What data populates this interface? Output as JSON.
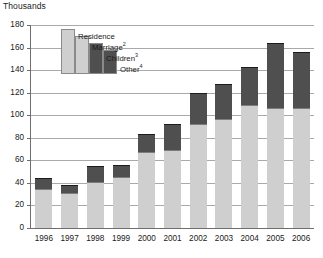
{
  "chart_data": {
    "type": "bar",
    "subtype": "stacked-column",
    "title": "Thousands",
    "xlabel": "",
    "ylabel": "Thousands",
    "ylim": [
      0,
      180
    ],
    "ytick_step": 20,
    "grid": true,
    "legend_position": "inside-top-left",
    "categories": [
      "1996",
      "1997",
      "1998",
      "1999",
      "2000",
      "2001",
      "2002",
      "2003",
      "2004",
      "2005",
      "2006"
    ],
    "series": [
      {
        "name": "Residence",
        "color": "#cfcfcf",
        "values": [
          22,
          19,
          24,
          26,
          39,
          40,
          52,
          55,
          59,
          79,
          79
        ]
      },
      {
        "name": "Marriage",
        "color": "#cfcfcf",
        "values": [
          13,
          12,
          17,
          19,
          28,
          29,
          40,
          42,
          50,
          27,
          27
        ]
      },
      {
        "name": "Children",
        "color": "#4f4f4f",
        "values": [
          8,
          6,
          13,
          10,
          15,
          22,
          27,
          30,
          33,
          56,
          49
        ]
      },
      {
        "name": "Other",
        "color": "#4f4f4f",
        "values": [
          1,
          1,
          1,
          1,
          1,
          1,
          1,
          1,
          1,
          2,
          1
        ]
      }
    ],
    "totals": [
      44,
      38,
      55,
      56,
      83,
      92,
      120,
      128,
      143,
      164,
      156
    ]
  },
  "axis": {
    "title": "Thousands",
    "y_ticks": [
      "180",
      "160",
      "140",
      "120",
      "100",
      "80",
      "60",
      "40",
      "20",
      "0"
    ],
    "x_ticks": [
      "1996",
      "1997",
      "1998",
      "1999",
      "2000",
      "2001",
      "2002",
      "2003",
      "2004",
      "2005",
      "2006"
    ]
  },
  "legend": {
    "items": [
      {
        "label": "Residence",
        "sup": "",
        "color": "#cfcfcf"
      },
      {
        "label": "Marriage",
        "sup": "2",
        "color": "#cfcfcf"
      },
      {
        "label": "Children",
        "sup": "3",
        "color": "#4f4f4f"
      },
      {
        "label": "Other",
        "sup": "4",
        "color": "#4f4f4f"
      }
    ]
  }
}
